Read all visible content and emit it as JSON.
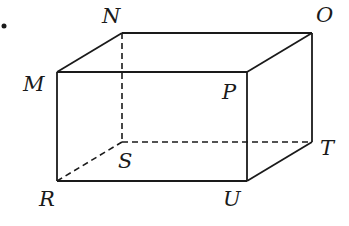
{
  "diagram": {
    "type": "rectangular-prism",
    "colors": {
      "line": "#1a1a1a",
      "background": "#ffffff"
    },
    "vertices": {
      "N": {
        "label": "N",
        "x": 122,
        "y": 33
      },
      "O": {
        "label": "O",
        "x": 312,
        "y": 33
      },
      "M": {
        "label": "M",
        "x": 57,
        "y": 72
      },
      "P": {
        "label": "P",
        "x": 247,
        "y": 72
      },
      "S": {
        "label": "S",
        "x": 122,
        "y": 142
      },
      "T": {
        "label": "T",
        "x": 312,
        "y": 142
      },
      "R": {
        "label": "R",
        "x": 57,
        "y": 181
      },
      "U": {
        "label": "U",
        "x": 247,
        "y": 181
      }
    },
    "solid_edges": [
      "MN",
      "NO",
      "MP",
      "PO",
      "MR",
      "PU",
      "OT",
      "RU",
      "UT"
    ],
    "hidden_edges": [
      "NS",
      "RS",
      "ST"
    ]
  }
}
